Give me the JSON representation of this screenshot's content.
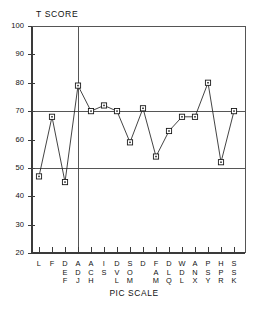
{
  "chart_data": {
    "type": "line",
    "title": "T SCORE",
    "ylabel": "T SCORE",
    "xlabel": "PIC SCALE",
    "ylim": [
      20,
      100
    ],
    "y_ticks": [
      20,
      30,
      40,
      50,
      60,
      70,
      80,
      90,
      100
    ],
    "grid": false,
    "legend": "none",
    "marker": "open-square",
    "reference_lines": [
      {
        "value": 70,
        "orientation": "horizontal"
      },
      {
        "value": 50,
        "orientation": "horizontal"
      }
    ],
    "vertical_divider_after_category": "ADJ",
    "categories": [
      "L",
      "F",
      "DEF",
      "ADJ",
      "ACH",
      "IS",
      "DVL",
      "SOM",
      "D",
      "FAM",
      "DLQ",
      "WDL",
      "ANX",
      "PSY",
      "HPR",
      "SSK"
    ],
    "values": [
      47,
      68,
      45,
      79,
      70,
      72,
      70,
      59,
      71,
      54,
      63,
      68,
      68,
      80,
      52,
      70
    ]
  },
  "axis": {
    "y_title": "T SCORE",
    "x_title": "PIC SCALE"
  }
}
